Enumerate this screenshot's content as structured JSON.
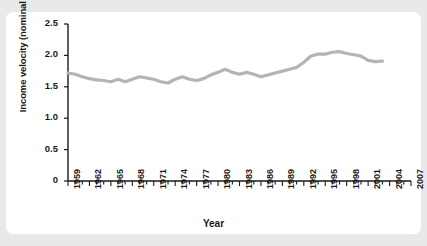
{
  "figure": {
    "background_color": "#e9e9e9",
    "card_color": "#ffffff",
    "line_color": "#b4b4b4",
    "axis_color": "#1a1a1a"
  },
  "axis_titles": {
    "y": "Income velocity (nominal GDP/M2)",
    "x": "Year"
  },
  "chart_data": {
    "type": "line",
    "title": "",
    "xlabel": "Year",
    "ylabel": "Income velocity (nominal GDP/M2)",
    "xlim": [
      1959,
      2007
    ],
    "ylim": [
      0,
      2.5
    ],
    "grid": false,
    "legend": "none",
    "y_ticks": [
      "0",
      "0.5",
      "1.0",
      "1.5",
      "2.0",
      "2.5"
    ],
    "y_tick_values": [
      0,
      0.5,
      1.0,
      1.5,
      2.0,
      2.5
    ],
    "x_ticks": [
      "1959",
      "1962",
      "1965",
      "1968",
      "1971",
      "1974",
      "1977",
      "1980",
      "1983",
      "1986",
      "1989",
      "1992",
      "1995",
      "1998",
      "2001",
      "2004",
      "2007"
    ],
    "x_tick_values": [
      1959,
      1962,
      1965,
      1968,
      1971,
      1974,
      1977,
      1980,
      1983,
      1986,
      1989,
      1992,
      1995,
      1998,
      2001,
      2004,
      2007
    ],
    "x_minor_tick_step": 1,
    "series": [
      {
        "name": "Income velocity",
        "color": "#b4b4b4",
        "x": [
          1959,
          1960,
          1961,
          1962,
          1963,
          1964,
          1965,
          1966,
          1967,
          1968,
          1969,
          1970,
          1971,
          1972,
          1973,
          1974,
          1975,
          1976,
          1977,
          1978,
          1979,
          1980,
          1981,
          1982,
          1983,
          1984,
          1985,
          1986,
          1987,
          1988,
          1989,
          1990,
          1991,
          1992,
          1993,
          1994,
          1995,
          1996,
          1997,
          1998,
          1999,
          2000,
          2001,
          2002,
          2003
        ],
        "values": [
          1.72,
          1.7,
          1.66,
          1.63,
          1.61,
          1.6,
          1.58,
          1.62,
          1.58,
          1.62,
          1.66,
          1.64,
          1.62,
          1.58,
          1.56,
          1.62,
          1.66,
          1.62,
          1.6,
          1.63,
          1.69,
          1.73,
          1.78,
          1.73,
          1.7,
          1.73,
          1.7,
          1.66,
          1.69,
          1.72,
          1.75,
          1.78,
          1.81,
          1.89,
          1.99,
          2.02,
          2.02,
          2.05,
          2.06,
          2.03,
          2.01,
          1.99,
          1.92,
          1.9,
          1.91
        ]
      }
    ]
  }
}
